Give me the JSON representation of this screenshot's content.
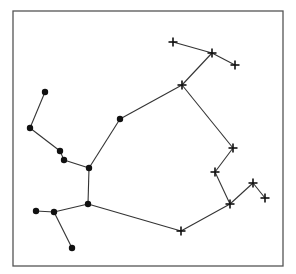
{
  "frame": {
    "x": 13,
    "y": 11,
    "width": 270,
    "height": 255,
    "stroke": "#555555"
  },
  "colors": {
    "line": "#333333",
    "node": "#111111"
  },
  "dot_nodes": [
    {
      "id": "d1",
      "x": 45,
      "y": 92
    },
    {
      "id": "d2",
      "x": 30,
      "y": 128
    },
    {
      "id": "d3",
      "x": 60,
      "y": 151
    },
    {
      "id": "d4",
      "x": 64,
      "y": 160
    },
    {
      "id": "d5",
      "x": 89,
      "y": 168
    },
    {
      "id": "d6",
      "x": 120,
      "y": 119
    },
    {
      "id": "d7",
      "x": 88,
      "y": 204
    },
    {
      "id": "d8",
      "x": 54,
      "y": 212
    },
    {
      "id": "d9",
      "x": 36,
      "y": 211
    },
    {
      "id": "d10",
      "x": 72,
      "y": 248
    }
  ],
  "plus_nodes": [
    {
      "id": "p1",
      "x": 173,
      "y": 42
    },
    {
      "id": "p2",
      "x": 212,
      "y": 53
    },
    {
      "id": "p3",
      "x": 235,
      "y": 65
    },
    {
      "id": "p4",
      "x": 182,
      "y": 85
    },
    {
      "id": "p5",
      "x": 233,
      "y": 148
    },
    {
      "id": "p6",
      "x": 215,
      "y": 172
    },
    {
      "id": "p7",
      "x": 230,
      "y": 204
    },
    {
      "id": "p8",
      "x": 253,
      "y": 183
    },
    {
      "id": "p9",
      "x": 265,
      "y": 198
    },
    {
      "id": "p10",
      "x": 181,
      "y": 231
    }
  ],
  "edges": [
    [
      "d1",
      "d2"
    ],
    [
      "d2",
      "d3"
    ],
    [
      "d3",
      "d4"
    ],
    [
      "d4",
      "d5"
    ],
    [
      "d5",
      "d6"
    ],
    [
      "d6",
      "p4"
    ],
    [
      "d5",
      "d7"
    ],
    [
      "d7",
      "d8"
    ],
    [
      "d8",
      "d9"
    ],
    [
      "d8",
      "d10"
    ],
    [
      "d7",
      "p10"
    ],
    [
      "p1",
      "p2"
    ],
    [
      "p2",
      "p3"
    ],
    [
      "p2",
      "p4"
    ],
    [
      "p4",
      "p5"
    ],
    [
      "p5",
      "p6"
    ],
    [
      "p6",
      "p7"
    ],
    [
      "p7",
      "p8"
    ],
    [
      "p8",
      "p9"
    ],
    [
      "p7",
      "p10"
    ]
  ]
}
